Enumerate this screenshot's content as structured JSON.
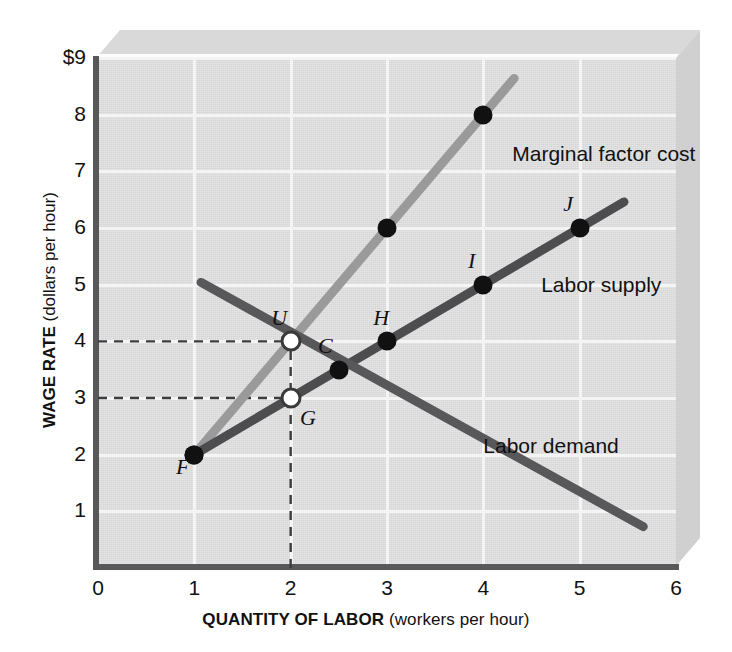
{
  "chart_data": {
    "type": "line",
    "title": "",
    "xlabel_bold": "QUANTITY OF LABOR",
    "xlabel_paren": "(workers per hour)",
    "ylabel_bold": "WAGE RATE",
    "ylabel_paren": "(dollars per hour)",
    "xlim": [
      0,
      6
    ],
    "ylim": [
      0,
      9
    ],
    "xticks": [
      "0",
      "1",
      "2",
      "3",
      "4",
      "5",
      "6"
    ],
    "yticks": [
      "$9",
      "8",
      "7",
      "6",
      "5",
      "4",
      "3",
      "2",
      "1"
    ],
    "ytick_values": [
      9,
      8,
      7,
      6,
      5,
      4,
      3,
      2,
      1
    ],
    "grid": true,
    "legend_position": "inline-labels",
    "series": [
      {
        "name": "Marginal factor cost",
        "label": "Marginal factor cost",
        "color": "#9a9a9a",
        "x": [
          1,
          4.32
        ],
        "y": [
          2,
          8.64
        ],
        "points": [
          {
            "label": "F",
            "x": 1,
            "y": 2,
            "style": "filled"
          },
          {
            "label": "U",
            "x": 2,
            "y": 4,
            "style": "open"
          },
          {
            "label": "",
            "x": 3,
            "y": 6,
            "style": "filled"
          },
          {
            "label": "",
            "x": 4,
            "y": 8,
            "style": "filled"
          }
        ]
      },
      {
        "name": "Labor supply",
        "label": "Labor supply",
        "color": "#4d4d4f",
        "x": [
          1,
          5.46
        ],
        "y": [
          2,
          6.46
        ],
        "points": [
          {
            "label": "F",
            "x": 1,
            "y": 2,
            "style": "filled"
          },
          {
            "label": "G",
            "x": 2,
            "y": 3,
            "style": "open"
          },
          {
            "label": "H",
            "x": 3,
            "y": 4,
            "style": "filled"
          },
          {
            "label": "I",
            "x": 4,
            "y": 5,
            "style": "filled"
          },
          {
            "label": "J",
            "x": 5,
            "y": 6,
            "style": "filled"
          }
        ]
      },
      {
        "name": "Labor demand",
        "label": "Labor demand",
        "color": "#58585a",
        "x": [
          1.07,
          5.66
        ],
        "y": [
          5.04,
          0.73
        ],
        "points": [
          {
            "label": "C",
            "x": 2.5,
            "y": 3.5,
            "style": "filled"
          }
        ]
      }
    ],
    "annotations": [
      {
        "type": "guide-h",
        "y": 4,
        "from_x": 0,
        "to_x": 2,
        "style": "dashed"
      },
      {
        "type": "guide-h",
        "y": 3,
        "from_x": 0,
        "to_x": 2,
        "style": "dashed"
      },
      {
        "type": "guide-v",
        "x": 2,
        "from_y": 0,
        "to_y": 4,
        "style": "dashed"
      }
    ],
    "curve_labels": [
      {
        "text": "Marginal factor cost",
        "x": 4.3,
        "y": 7.3
      },
      {
        "text": "Labor supply",
        "x": 4.6,
        "y": 5.0
      },
      {
        "text": "Labor demand",
        "x": 4.0,
        "y": 2.15
      }
    ],
    "point_labels": [
      {
        "text": "F",
        "x": 0.88,
        "y": 1.78
      },
      {
        "text": "U",
        "x": 1.88,
        "y": 4.42
      },
      {
        "text": "G",
        "x": 2.18,
        "y": 2.65
      },
      {
        "text": "C",
        "x": 2.36,
        "y": 3.92
      },
      {
        "text": "H",
        "x": 2.94,
        "y": 4.42
      },
      {
        "text": "I",
        "x": 3.88,
        "y": 5.42
      },
      {
        "text": "J",
        "x": 4.88,
        "y": 6.42
      }
    ],
    "colors": {
      "mfc": "#9a9a9a",
      "supply": "#4d4d4f",
      "demand": "#58585a",
      "plot_background": "#dcdcdc",
      "gridline": "#f4f4f4",
      "axis": "#58585a",
      "slab_top": "#d9d9d9",
      "slab_side": "#d0d0d0"
    }
  }
}
